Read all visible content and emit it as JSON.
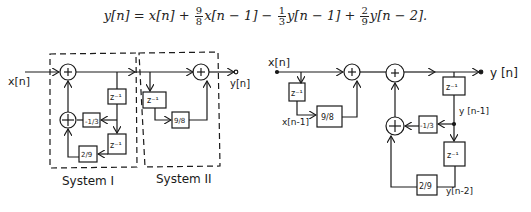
{
  "equation": {
    "lhs": "y[n]",
    "eq": " = ",
    "t1": "x[n] + ",
    "f1_num": "9",
    "f1_den": "8",
    "t2": "x[n − 1] − ",
    "f2_num": "1",
    "f2_den": "3",
    "t3": "y[n − 1] + ",
    "f3_num": "2",
    "f3_den": "9",
    "t4": "y[n − 2]."
  },
  "left_diagram": {
    "input_label": "x[n]",
    "output_label": "y[n]",
    "system1_label": "System I",
    "system2_label": "System II",
    "adder_symbol": "+",
    "delay_label": "z⁻¹",
    "gain_neg_third": "-1/3",
    "gain_two_ninths": "2/9",
    "gain_nine_eighths": "9/8"
  },
  "right_diagram": {
    "input_label": "x[n]",
    "delayed_input_label": "x[n-1]",
    "output_label": "y [n]",
    "y_n1_label": "y [n-1]",
    "y_n2_label": "y[n-2]",
    "adder_symbol": "+",
    "delay_label": "z⁻¹",
    "gain_nine_eighths": "9/8",
    "gain_neg_third": "-1/3",
    "gain_two_ninths": "2/9"
  },
  "colors": {
    "ink": "#1a1a1a",
    "background": "#ffffff"
  }
}
